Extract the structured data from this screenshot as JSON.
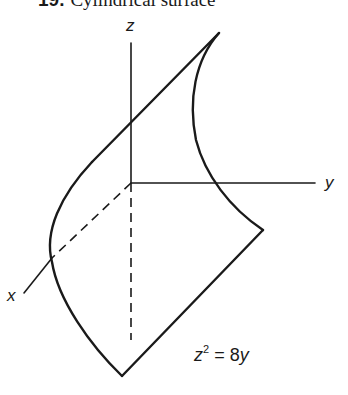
{
  "title": {
    "number": "19.",
    "text": "Cylindrical surface"
  },
  "axes": {
    "x_label": "x",
    "y_label": "y",
    "z_label": "z"
  },
  "equation": {
    "lhs_var": "z",
    "lhs_exp": "2",
    "op": "=",
    "rhs_coef": "8",
    "rhs_var": "y"
  },
  "colors": {
    "ink": "#1a1a1a",
    "background": "#ffffff"
  }
}
